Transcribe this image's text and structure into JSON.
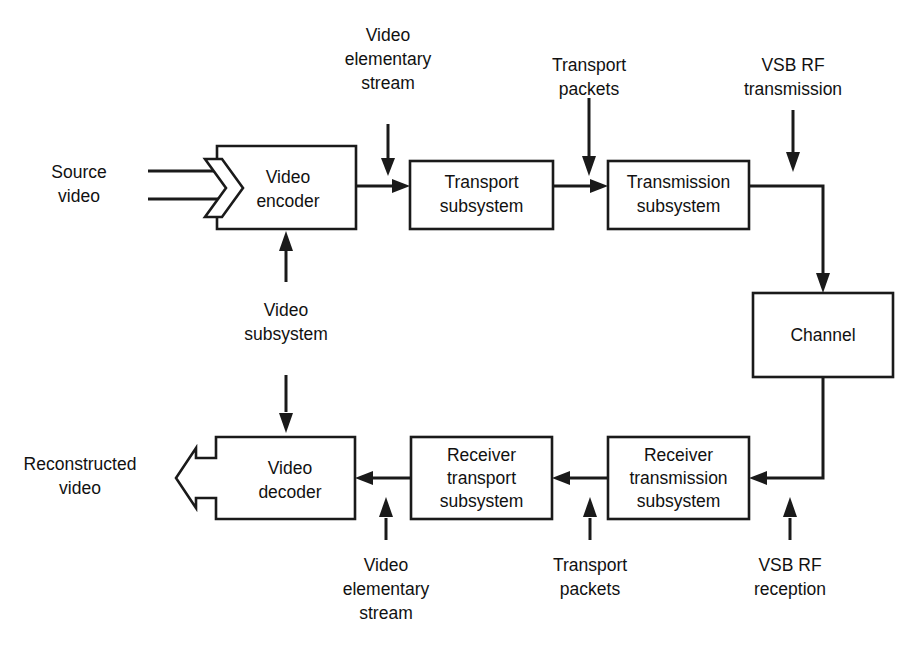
{
  "diagram": {
    "background_color": "#ffffff",
    "line_color": "#1a1a1a",
    "text_color": "#111111",
    "boxes": [
      {
        "id": "video_encoder",
        "line1": "Video",
        "line2": "encoder",
        "shape": "chevron-input-left",
        "x": 217,
        "y": 146,
        "w": 139,
        "h": 83
      },
      {
        "id": "transport_subsystem",
        "line1": "Transport",
        "line2": "subsystem",
        "shape": "rect",
        "x": 410,
        "y": 161,
        "w": 143,
        "h": 68
      },
      {
        "id": "transmission_subsystem",
        "line1": "Transmission",
        "line2": "subsystem",
        "shape": "rect",
        "x": 608,
        "y": 161,
        "w": 141,
        "h": 68
      },
      {
        "id": "channel",
        "line1": "Channel",
        "line2": "",
        "shape": "rect",
        "x": 753,
        "y": 293,
        "w": 140,
        "h": 84
      },
      {
        "id": "receiver_transmission_subsystem",
        "line1": "Receiver",
        "line2": "transmission",
        "line3": "subsystem",
        "shape": "rect",
        "x": 608,
        "y": 437,
        "w": 141,
        "h": 82
      },
      {
        "id": "receiver_transport_subsystem",
        "line1": "Receiver",
        "line2": "transport",
        "line3": "subsystem",
        "shape": "rect",
        "x": 411,
        "y": 437,
        "w": 141,
        "h": 82
      },
      {
        "id": "video_decoder",
        "line1": "Video",
        "line2": "decoder",
        "shape": "arrow-output-left",
        "x": 216,
        "y": 437,
        "w": 139,
        "h": 82
      }
    ],
    "labels": [
      {
        "id": "source_video",
        "lines": [
          "Source",
          "video"
        ],
        "x": 79,
        "y": 168,
        "align": "middle"
      },
      {
        "id": "video_elementary_stream_top",
        "lines": [
          "Video",
          "elementary",
          "stream"
        ],
        "x": 388,
        "y": 32,
        "align": "middle"
      },
      {
        "id": "transport_packets_top",
        "lines": [
          "Transport",
          "packets"
        ],
        "x": 589,
        "y": 62,
        "align": "middle"
      },
      {
        "id": "vsb_rf_transmission",
        "lines": [
          "VSB RF",
          "transmission"
        ],
        "x": 793,
        "y": 62,
        "align": "middle"
      },
      {
        "id": "video_subsystem",
        "lines": [
          "Video",
          "subsystem"
        ],
        "x": 286,
        "y": 310,
        "align": "middle"
      },
      {
        "id": "reconstructed_video",
        "lines": [
          "Reconstructed",
          "video"
        ],
        "x": 80,
        "y": 460,
        "align": "middle"
      },
      {
        "id": "video_elementary_stream_bottom",
        "lines": [
          "Video",
          "elementary",
          "stream"
        ],
        "x": 386,
        "y": 562,
        "align": "middle"
      },
      {
        "id": "transport_packets_bottom",
        "lines": [
          "Transport",
          "packets"
        ],
        "x": 590,
        "y": 562,
        "align": "middle"
      },
      {
        "id": "vsb_rf_reception",
        "lines": [
          "VSB RF",
          "reception"
        ],
        "x": 790,
        "y": 562,
        "align": "middle"
      }
    ],
    "connections": [
      {
        "id": "source-video-rail-upper",
        "from": "source video label",
        "to": "video encoder chevron",
        "direction": "right"
      },
      {
        "id": "source-video-rail-lower",
        "from": "source video label",
        "to": "video encoder chevron",
        "direction": "right"
      },
      {
        "id": "encoder-to-transport",
        "from": "video encoder",
        "to": "transport subsystem",
        "direction": "right"
      },
      {
        "id": "ves-top-into-transport",
        "from": "video elementary stream",
        "to": "transport subsystem input",
        "direction": "down"
      },
      {
        "id": "transport-to-transmission",
        "from": "transport subsystem",
        "to": "transmission subsystem",
        "direction": "right"
      },
      {
        "id": "tp-top-into-transmission",
        "from": "transport packets",
        "to": "transmission subsystem input",
        "direction": "down"
      },
      {
        "id": "vsbrf-tx-into-channel-link",
        "from": "VSB RF transmission",
        "to": "transmission output path",
        "direction": "down"
      },
      {
        "id": "transmission-to-channel",
        "from": "transmission subsystem",
        "to": "channel",
        "direction": "right-then-down"
      },
      {
        "id": "channel-to-receiver-transmission",
        "from": "channel",
        "to": "receiver transmission subsystem",
        "direction": "down-then-left"
      },
      {
        "id": "vsbrf-rx-into-receiver-transmission",
        "from": "VSB RF reception",
        "to": "receiver transmission subsystem",
        "direction": "up"
      },
      {
        "id": "receiver-transmission-to-receiver-transport",
        "from": "receiver transmission subsystem",
        "to": "receiver transport subsystem",
        "direction": "left"
      },
      {
        "id": "tp-bottom-into-receiver-transport",
        "from": "transport packets",
        "to": "receiver transport subsystem",
        "direction": "up"
      },
      {
        "id": "receiver-transport-to-decoder",
        "from": "receiver transport subsystem",
        "to": "video decoder",
        "direction": "left"
      },
      {
        "id": "ves-bottom-into-decoder",
        "from": "video elementary stream",
        "to": "video decoder",
        "direction": "up"
      },
      {
        "id": "video-subsystem-up-to-encoder",
        "from": "video subsystem",
        "to": "video encoder",
        "direction": "up"
      },
      {
        "id": "video-subsystem-down-to-decoder",
        "from": "video subsystem",
        "to": "video decoder",
        "direction": "down"
      }
    ]
  }
}
